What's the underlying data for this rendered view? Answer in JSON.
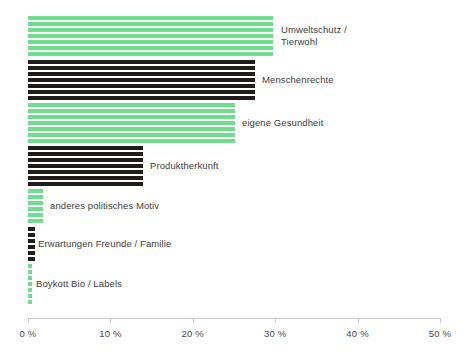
{
  "chart_data": {
    "type": "bar",
    "orientation": "horizontal",
    "title": "",
    "subtitle": "",
    "xlabel": "",
    "ylabel": "",
    "xlim": [
      0,
      50
    ],
    "xunit": "%",
    "grid": false,
    "legend": null,
    "colors": {
      "green": "#6fdd8b",
      "black": "#201c1c",
      "axis": "#c9c9c9",
      "label_text": "#3d3d3d",
      "tick_text": "#4a4a4a",
      "background": "#ffffff"
    },
    "bar_style": "horizontally-striped",
    "categories": [
      "Umweltschutz /\nTierwohl",
      "Menschenrechte",
      "eigene Gesundheit",
      "Produktherkunft",
      "anderes politisches Motiv",
      "Erwartungen Freunde / Familie",
      "Boykott Bio / Labels"
    ],
    "values": [
      29.7,
      27.5,
      25.1,
      14.0,
      1.8,
      0.8,
      0.5
    ],
    "series_colors": [
      "green",
      "black",
      "green",
      "black",
      "green",
      "black",
      "green"
    ],
    "ticks": [
      {
        "value": 0,
        "label": "0 %"
      },
      {
        "value": 10,
        "label": "10 %"
      },
      {
        "value": 20,
        "label": "20 %"
      },
      {
        "value": 30,
        "label": "30 %"
      },
      {
        "value": 40,
        "label": "40 %"
      },
      {
        "value": 50,
        "label": "50 %"
      }
    ]
  }
}
